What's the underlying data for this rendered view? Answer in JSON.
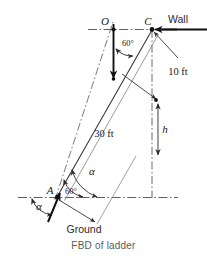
{
  "figure": {
    "caption": "FBD of ladder",
    "title": "FBD of ladder",
    "points": {
      "O": {
        "label": "O",
        "x": 113,
        "y": 30,
        "desc": "center-of-gravity point on upper horizontal reference"
      },
      "C": {
        "label": "C",
        "x": 152,
        "y": 30,
        "desc": "ladder top contact at wall"
      },
      "A": {
        "label": "A",
        "x": 57,
        "y": 197,
        "desc": "ladder base contact at ground"
      }
    },
    "labels": {
      "wall": "Wall",
      "ground": "Ground",
      "point_o": "O",
      "point_c": "C",
      "point_a": "A",
      "dim_ten_ft": "10 ft",
      "dim_thirty_ft": "30 ft",
      "dim_h": "h",
      "angle_sixty_top": "60°",
      "angle_sixty_base": "60°",
      "angle_alpha_base_upper": "α",
      "angle_alpha_base_lower": "α"
    },
    "values": {
      "wall_distance_ft": 10,
      "ladder_length_ft": 30,
      "angle_deg": 60,
      "unknown_height_symbol": "h"
    },
    "colors": {
      "line": "#1a1a1a",
      "thin_line": "#6b6b6b",
      "center_line": "#7a7a7a",
      "background": "#ffffff",
      "caption": "#5a5a5a"
    },
    "icons": {
      "weight-arrow-icon": "downward force vector at O",
      "wall-reaction-arrow-icon": "leftward force vector at C",
      "ground-reaction-arrow-icon": "upward-right force vector at A",
      "dimension-arrow-icon": "dimension arrowhead"
    }
  }
}
